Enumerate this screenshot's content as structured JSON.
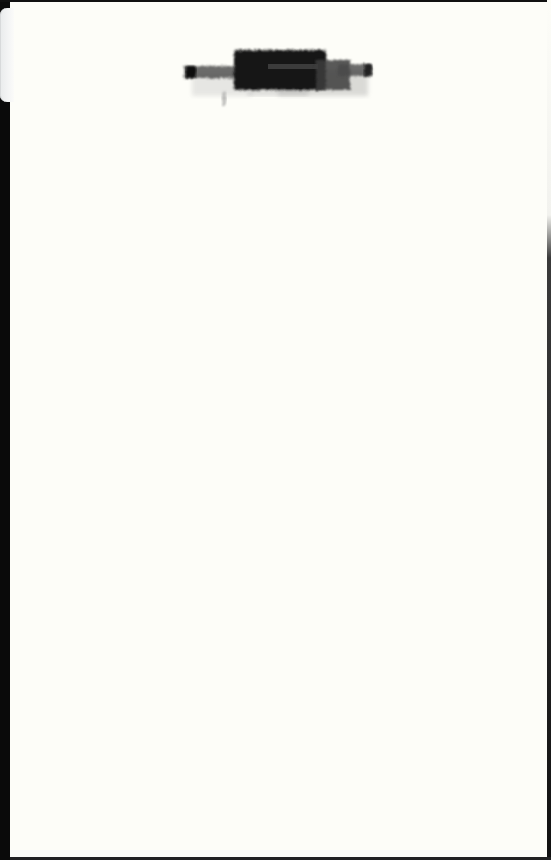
{
  "document": {
    "type": "scanned-page",
    "page_color": "#fdfdf8",
    "border_color": "#0c0c0c",
    "redaction": {
      "label": "",
      "legible": false,
      "color": "#151515"
    }
  }
}
